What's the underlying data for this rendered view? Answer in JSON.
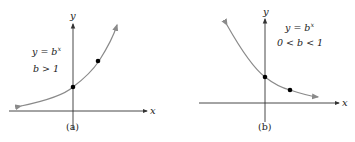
{
  "panels": [
    {
      "caption": "(a)",
      "equation": "y = b",
      "exponent": "x",
      "condition": "b > 1",
      "axis_x_label": "x",
      "axis_y_label": "y"
    },
    {
      "caption": "(b)",
      "equation": "y = b",
      "exponent": "x",
      "condition": "0 < b < 1",
      "axis_x_label": "x",
      "axis_y_label": "y"
    }
  ],
  "colors": {
    "axis": "#333333",
    "curve": "#8a8a8a",
    "point": "#000000"
  }
}
